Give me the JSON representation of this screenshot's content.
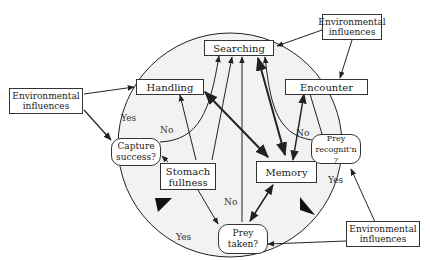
{
  "nodes": {
    "searching": "Searching",
    "handling": "Handling",
    "encounter": "Encounter",
    "memory": "Memory",
    "stomach": "Stomach fullness",
    "capture": "Capture success?",
    "recognition": "Prey recognit'n ?",
    "taken": "Prey taken?",
    "env_top": "Environmental influences",
    "env_left": "Environmental influences",
    "env_bottom": "Environmental influences"
  },
  "edge_labels": {
    "yes_capture": "Yes",
    "no_capture": "No",
    "no_recognition": "No",
    "yes_recognition": "Yes",
    "no_taken": "No",
    "yes_taken": "Yes"
  },
  "colors": {
    "circle_fill": "#f2f2f2",
    "stroke": "#222222"
  }
}
